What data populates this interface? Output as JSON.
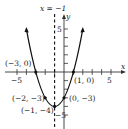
{
  "graph": {
    "type": "parabola",
    "equation_hint": "y = (x + 1)^2 - 4",
    "axis_of_symmetry_label": "x = −1",
    "x_axis_label": "x",
    "y_axis_label": "y",
    "x_tick_labels": {
      "neg": "−5",
      "pos": "5"
    },
    "y_tick_labels": {
      "pos": "5",
      "neg": "−5"
    },
    "points": [
      {
        "label": "(−3, 0)",
        "x": -3,
        "y": 0
      },
      {
        "label": "(1, 0)",
        "x": 1,
        "y": 0
      },
      {
        "label": "(−2, −3)",
        "x": -2,
        "y": -3
      },
      {
        "label": "(0, −3)",
        "x": 0,
        "y": -3
      },
      {
        "label": "(−1, −4)",
        "x": -1,
        "y": -4
      }
    ],
    "colors": {
      "curve": "#111111",
      "axes": "#333333",
      "text": "#222222"
    }
  }
}
